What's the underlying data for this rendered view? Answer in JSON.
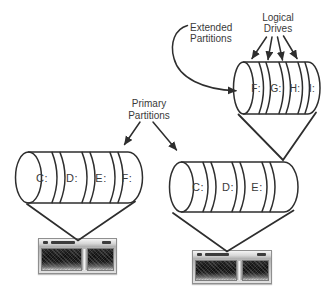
{
  "window": {
    "background": "#ffffff"
  },
  "colors": {
    "line": "#2e2e2e",
    "text": "#3a3a3a"
  },
  "annotations": {
    "extended_partitions": {
      "line1": "Extended",
      "line2": "Partitions"
    },
    "logical_drives": {
      "line1": "Logical",
      "line2": "Drives"
    },
    "primary_partitions": {
      "line1": "Primary",
      "line2": "Partitions"
    }
  },
  "disks": {
    "left_primary": {
      "segments": [
        "C:",
        "D:",
        "E:",
        "F:"
      ]
    },
    "right_primary": {
      "segments": [
        "C:",
        "D:",
        "E:"
      ]
    },
    "logical_drives": {
      "segments": [
        "F:",
        "G:",
        "H:",
        "I:"
      ]
    }
  },
  "images": {
    "left_computer": "computer-photo",
    "right_computer": "computer-photo"
  }
}
